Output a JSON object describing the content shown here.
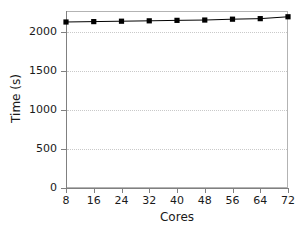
{
  "chart_data": {
    "type": "line",
    "title": "",
    "xlabel": "Cores",
    "ylabel": "Time (s)",
    "x": [
      8,
      16,
      24,
      32,
      40,
      48,
      56,
      64,
      72
    ],
    "series": [
      {
        "name": "Time",
        "values": [
          2129,
          2134,
          2139,
          2144,
          2150,
          2154,
          2165,
          2172,
          2196
        ],
        "color": "#000000",
        "marker": "square",
        "linewidth": 1
      }
    ],
    "xlim": [
      8,
      72
    ],
    "ylim": [
      0,
      2270
    ],
    "xticks": [
      8,
      16,
      24,
      32,
      40,
      48,
      56,
      64,
      72
    ],
    "xtick_labels": [
      "8",
      "16",
      "24",
      "32",
      "40",
      "48",
      "56",
      "64",
      "72"
    ],
    "yticks": [
      0,
      500,
      1000,
      1500,
      2000
    ],
    "ytick_labels": [
      "0",
      "500",
      "1000",
      "1500",
      "2000"
    ],
    "grid": "horizontal-dotted",
    "legend": "none",
    "background": "#ffffff",
    "frame_color": "#b3b3b3",
    "grid_color": "#c9c9c9",
    "axis_color": "#808080",
    "text_color": "#1a1a1a"
  }
}
